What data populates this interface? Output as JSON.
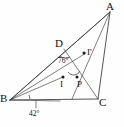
{
  "figure": {
    "type": "geometry-diagram",
    "stroke_color": "#2b2b2b",
    "background_color": "#ffffff",
    "vertices": [
      {
        "name": "A",
        "label": "A",
        "x": 110,
        "y": 12,
        "label_x": 108,
        "label_y": 1
      },
      {
        "name": "B",
        "label": "B",
        "x": 10,
        "y": 100,
        "label_x": 0,
        "label_y": 93
      },
      {
        "name": "C",
        "label": "C",
        "x": 98,
        "y": 99,
        "label_x": 99,
        "label_y": 98
      }
    ],
    "points": [
      {
        "name": "D",
        "label": "D",
        "x": 64,
        "y": 49,
        "label_x": 55,
        "label_y": 38,
        "has_dot": false
      },
      {
        "name": "I",
        "label": "I",
        "x": 63,
        "y": 77,
        "label_x": 59,
        "label_y": 81,
        "has_dot": true
      },
      {
        "name": "P",
        "label": "P",
        "x": 77,
        "y": 77,
        "label_x": 77,
        "label_y": 80,
        "has_dot": true
      },
      {
        "name": "Iprime",
        "label": "I'",
        "x": 86,
        "y": 53,
        "label_x": 88,
        "label_y": 49,
        "has_dot": true
      }
    ],
    "angles": [
      {
        "name": "angle-at-D",
        "label": "76°",
        "label_x": 61,
        "label_y": 60,
        "vertex": "D"
      },
      {
        "name": "angle-at-B",
        "label": "42°",
        "label_x": 30,
        "label_y": 112,
        "vertex": "B"
      }
    ],
    "segments": [
      {
        "name": "side-BA",
        "from": "B",
        "to": "A"
      },
      {
        "name": "side-BC",
        "from": "B",
        "to": "C"
      },
      {
        "name": "side-AC",
        "from": "A",
        "to": "C"
      },
      {
        "name": "cevian-D-C",
        "from": "D",
        "to": "C"
      },
      {
        "name": "cevian-A-B",
        "from": "A",
        "to": "B"
      },
      {
        "name": "cevian-A-P",
        "from": "A",
        "to": "P"
      },
      {
        "name": "segment-B-I",
        "from": "B",
        "to": "I"
      },
      {
        "name": "segment-B-P",
        "from": "B",
        "to": "P"
      }
    ]
  }
}
